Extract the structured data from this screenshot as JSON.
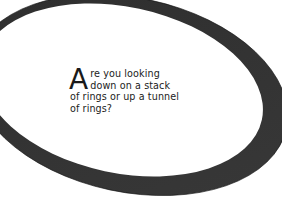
{
  "figure": {
    "ring": {
      "color": "#333333",
      "outer": {
        "cx": 128,
        "cy": 96,
        "rx": 158,
        "ry": 96,
        "rotate": 12
      },
      "inner": {
        "cx": 123,
        "cy": 90,
        "rx": 142,
        "ry": 84,
        "rotate": 12
      }
    },
    "caption": {
      "drop_cap": "A",
      "text": "re you looking down on a stack of rings or up a tunnel of rings?"
    }
  }
}
